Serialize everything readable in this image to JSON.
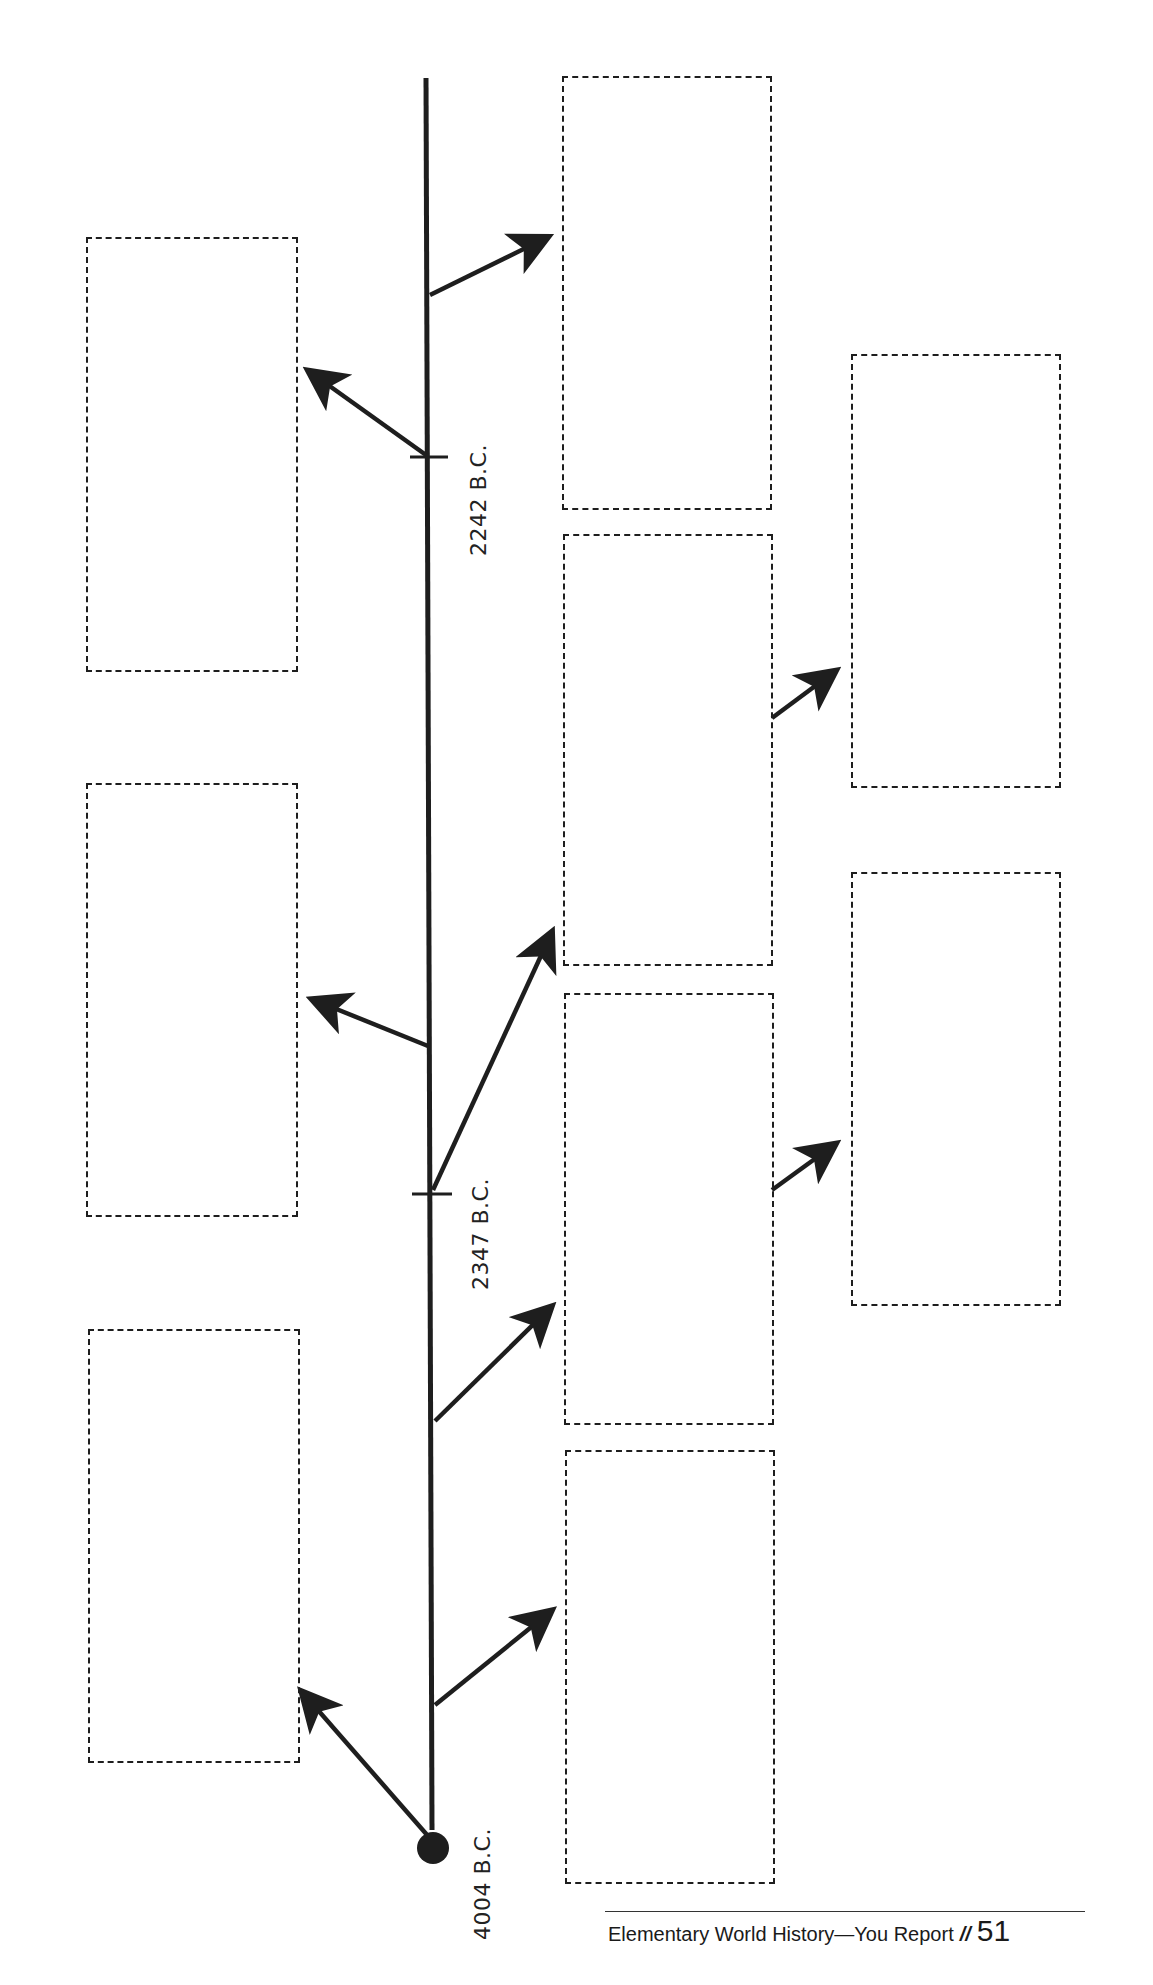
{
  "timeline": {
    "start_label": "4004 B.C.",
    "markers": [
      {
        "label": "2347 B.C."
      },
      {
        "label": "2242 B.C."
      }
    ]
  },
  "boxes": {
    "left_column": [
      {
        "text": ""
      },
      {
        "text": ""
      },
      {
        "text": ""
      }
    ],
    "center_column": [
      {
        "text": ""
      },
      {
        "text": ""
      },
      {
        "text": ""
      },
      {
        "text": ""
      }
    ],
    "right_column": [
      {
        "text": ""
      },
      {
        "text": ""
      }
    ]
  },
  "footer": {
    "title": "Elementary World History—You Report",
    "separator": "//",
    "page_number": "51"
  },
  "colors": {
    "ink": "#1e1e1e",
    "background": "#ffffff"
  }
}
